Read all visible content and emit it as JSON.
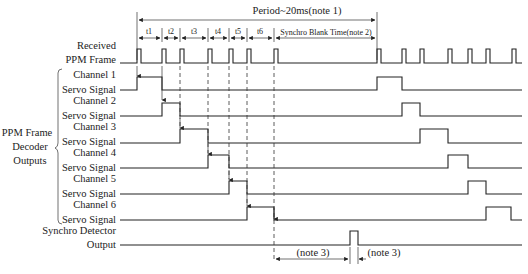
{
  "period_label": "Period~20ms(note 1)",
  "blank_label": "Synchro Blank Time(note 2)",
  "interval_labels": [
    "t1",
    "t2",
    "t3",
    "t4",
    "t5",
    "t6"
  ],
  "group_label": [
    "PPM Frame",
    "Decoder",
    "Outputs"
  ],
  "signals": [
    {
      "line1": "Received",
      "line2": "PPM Frame"
    },
    {
      "line1": "Channel 1",
      "line2": "Servo Signal"
    },
    {
      "line1": "Channel 2",
      "line2": "Servo Signal"
    },
    {
      "line1": "Channel 3",
      "line2": "Servo Signal"
    },
    {
      "line1": "Channel 4",
      "line2": "Servo Signal"
    },
    {
      "line1": "Channel 5",
      "line2": "Servo Signal"
    },
    {
      "line1": "Channel 6",
      "line2": "Servo Signal"
    },
    {
      "line1": "Synchro Detector",
      "line2": "Output"
    }
  ],
  "notes": {
    "note3_a": "(note 3)",
    "note3_b": "(note 3)"
  },
  "colors": {
    "line": "#222222",
    "background": "#ffffff"
  },
  "pulse_edges_frame1": [
    137,
    162,
    180,
    208,
    229,
    247,
    274
  ],
  "pulse_edges_frame2": [
    377,
    402,
    420,
    448,
    468,
    486,
    512
  ]
}
